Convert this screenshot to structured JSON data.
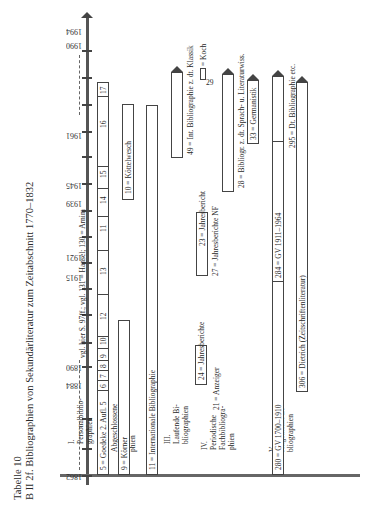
{
  "table": {
    "number": "Tabelle 10",
    "title": "B II 2f. Bibliographien von Sekundärliteratur zum Zeitabschnitt 1770–1832"
  },
  "years": [
    "1862",
    "1884",
    "1890",
    "1915",
    "1921",
    "1939",
    "1945",
    "1961",
    "1990",
    "1994"
  ],
  "sections": [
    {
      "num": "I.",
      "lines": [
        "Personalbiblio-",
        "graphien"
      ]
    },
    {
      "num": "II.",
      "lines": [
        "Abgeschlossene",
        "Fachbibliogra-",
        "phien"
      ]
    },
    {
      "num": "III.",
      "lines": [
        "Laufende Bi-",
        "bliographien"
      ]
    },
    {
      "num": "IV.",
      "lines": [
        "Periodische",
        "Fachbibliogra-",
        "phien"
      ]
    },
    {
      "num": "V.",
      "lines": [
        "Allgemeine Bi-",
        "bliographien"
      ]
    }
  ],
  "entries": {
    "personal": "vgl. hier S. 97ff.; vgl. 131 = Hansel; 130 = Arnim",
    "goedeke": "5 = Goedeke 2. Aufl. 5",
    "goedeke_cells": [
      "6",
      "7",
      "8",
      "9",
      "10",
      "12",
      "13",
      "11",
      "14",
      "15",
      "16",
      "17"
    ],
    "koerner": "9 = Körner",
    "koenelwesch": "10 = Köttelwesch",
    "ib": "11 = Internationale Bibliographie",
    "int_klassik": "49 = Int. Bibliographie z. dt. Klassik",
    "koch": "= Koch",
    "koch_num": "29",
    "jb24": "24 = Jahresberichte",
    "anzeiger": "21 = Anzeiger",
    "jb23": "23 = Jahresbericht",
    "jbnf": "27 = Jahresberichte NF",
    "bibl28": "28 = Bibliogr. z. dt. Sprach- u. Literaturwiss.",
    "germanistik": "33 = Germanistik",
    "gv1700": "280 = GV 1700–1910",
    "gv1911": "284 = GV 1911–1964",
    "dtbib": "295 = Dt. Bibliographie etc.",
    "dietrich": "306 = Dietrich (Zeitschriftenliteratur)"
  }
}
